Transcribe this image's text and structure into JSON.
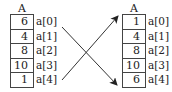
{
  "diagram": {
    "left_array": {
      "title": "A",
      "values": [
        "6",
        "4",
        "8",
        "10",
        "1"
      ],
      "indices": [
        "a[0]",
        "a[1]",
        "a[2]",
        "a[3]",
        "a[4]"
      ]
    },
    "right_array": {
      "title": "A",
      "values": [
        "1",
        "4",
        "8",
        "10",
        "6"
      ],
      "indices": [
        "a[0]",
        "a[1]",
        "a[2]",
        "a[3]",
        "a[4]"
      ]
    },
    "arrows": [
      {
        "from": "left a[0]",
        "to": "right a[4]",
        "meaning": "6 moves to a[4]"
      },
      {
        "from": "left a[4]",
        "to": "right a[0]",
        "meaning": "1 moves to a[0]"
      }
    ],
    "colors": {
      "line": "#333333",
      "background": "#ffffff"
    }
  }
}
